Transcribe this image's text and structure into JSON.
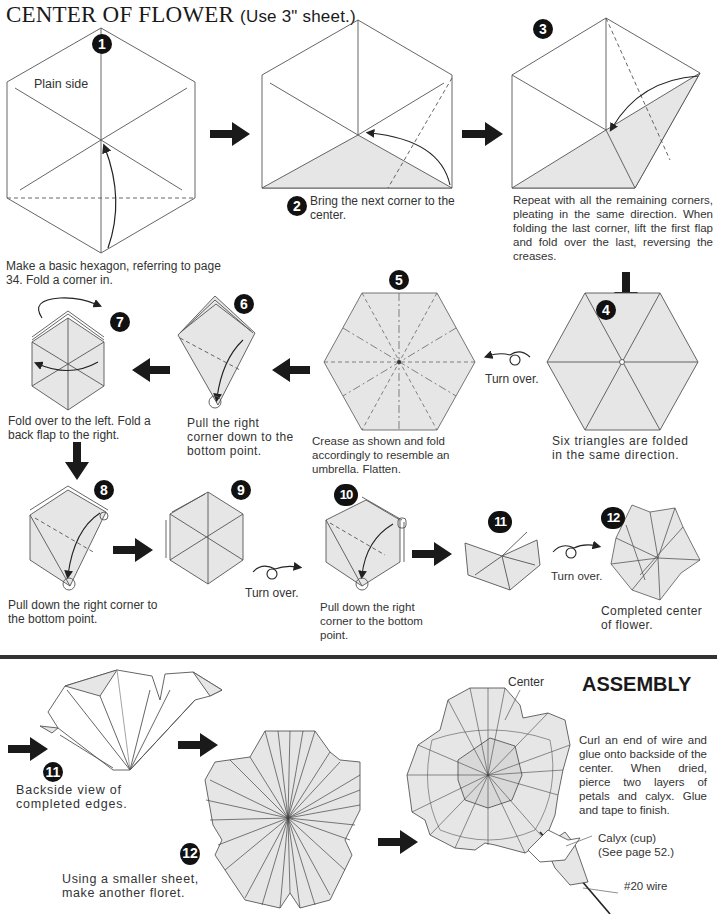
{
  "page": {
    "title": "CENTER OF FLOWER",
    "title_note": "(Use 3\" sheet.)"
  },
  "steps": [
    {
      "num": "1",
      "label": "Plain side",
      "caption": "Make a basic hexagon, referring to page 34. Fold a corner in."
    },
    {
      "num": "2",
      "caption": "Bring the next corner to the center."
    },
    {
      "num": "3",
      "caption": "Repeat with all the remaining corners, pleating in the same direction. When folding the last corner, lift the first flap and fold over the last, reversing the creases."
    },
    {
      "num": "4",
      "caption": "Six triangles are folded in the same direction."
    },
    {
      "num": "5",
      "caption": "Crease as shown and fold accordingly to resemble an umbrella. Flatten."
    },
    {
      "num": "6",
      "caption": "Pull the right corner down to the bottom point."
    },
    {
      "num": "7",
      "caption": "Fold over to the left. Fold a back flap to the right."
    },
    {
      "num": "8",
      "caption": "Pull down the right corner to the bottom point."
    },
    {
      "num": "9",
      "caption": ""
    },
    {
      "num": "10",
      "caption": "Pull down the right corner to the bottom point."
    },
    {
      "num": "11",
      "caption": ""
    },
    {
      "num": "12",
      "caption": "Completed center of flower."
    }
  ],
  "turn_over": {
    "label": "Turn over."
  },
  "assembly": {
    "heading": "ASSEMBLY",
    "steps": [
      {
        "num": "11",
        "caption": "Backside view of completed edges."
      },
      {
        "num": "12",
        "caption": "Using a smaller sheet, make another floret."
      }
    ],
    "instructions": "Curl an end of wire and glue onto backside of the center. When dried, pierce two layers of petals and calyx. Glue and tape to finish.",
    "labels": {
      "center": "Center",
      "calyx": "Calyx (cup)",
      "calyx_ref": "(See page 52.)",
      "wire": "#20 wire"
    }
  },
  "colors": {
    "paper_fill": "#e6e6e6",
    "line": "#555555",
    "badge": "#111111",
    "arrow": "#1a1a1a"
  }
}
